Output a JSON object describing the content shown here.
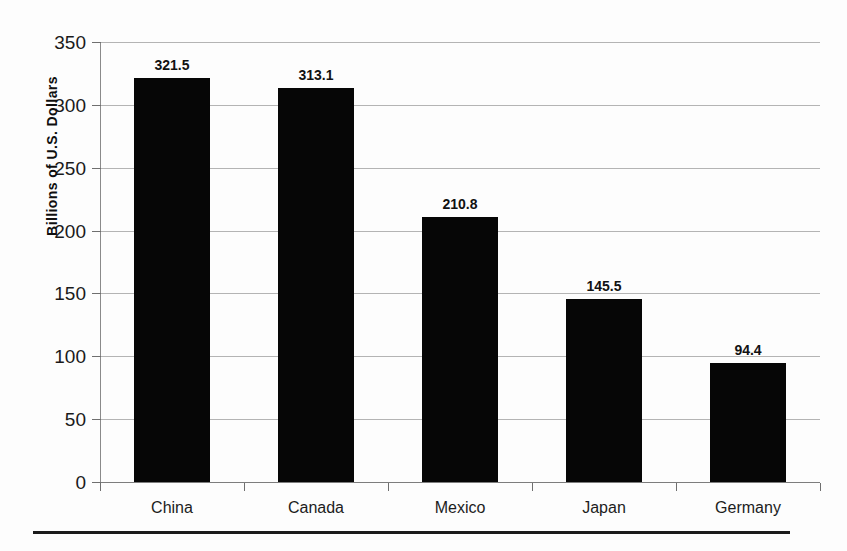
{
  "chart_data": {
    "type": "bar",
    "title": "",
    "subtitle": "",
    "xlabel": "",
    "ylabel": "Billions of U.S. Dollars",
    "categories": [
      "China",
      "Canada",
      "Mexico",
      "Japan",
      "Germany"
    ],
    "values": [
      321.5,
      313.1,
      210.8,
      145.5,
      94.4
    ],
    "value_labels": [
      "321.5",
      "313.1",
      "210.8",
      "145.5",
      "94.4"
    ],
    "ylim": [
      0,
      350
    ],
    "ytick_values": [
      0,
      50,
      100,
      150,
      200,
      250,
      300,
      350
    ],
    "ytick_labels": [
      "0",
      "50",
      "100",
      "150",
      "200",
      "250",
      "300",
      "350"
    ],
    "grid": "horizontal",
    "legend": "none",
    "series": [
      {
        "name": "",
        "values": [
          321.5,
          313.1,
          210.8,
          145.5,
          94.4
        ]
      }
    ],
    "colors": {
      "bar": "#060606",
      "gridline": "#b4b4b4",
      "axis": "#8a8a8a",
      "text": "#111111",
      "background": "#fdfdfd",
      "rule": "#1b1b1b"
    }
  }
}
